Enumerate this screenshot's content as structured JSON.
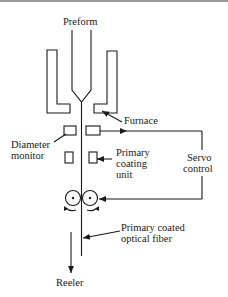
{
  "diagram": {
    "labels": {
      "preform": "Preform",
      "furnace": "Furnace",
      "diameter_monitor_line1": "Diameter",
      "diameter_monitor_line2": "monitor",
      "primary_coating_line1": "Primary",
      "primary_coating_line2": "coating",
      "primary_coating_line3": "unit",
      "servo_line1": "Servo",
      "servo_line2": "control",
      "fiber_line1": "Primary coated",
      "fiber_line2": "optical fiber",
      "reeler": "Reeler"
    },
    "colors": {
      "stroke": "#1a1a1a",
      "background": "#ffffff"
    }
  }
}
